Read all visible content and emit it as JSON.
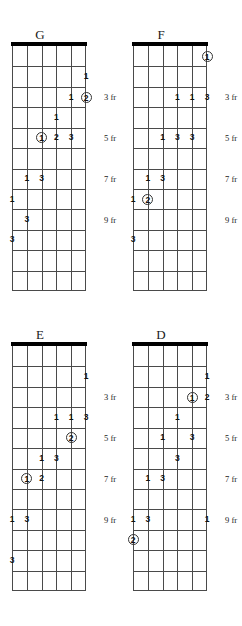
{
  "page": {
    "kind": "guitar-scale-diagrams",
    "width": 242,
    "height": 626,
    "strings": 6,
    "frets": 12,
    "ink_color": "#4a4a4a",
    "nut_color": "#000000",
    "text_color": "#1a1a1a"
  },
  "fret_label_text": {
    "f3": "3 fr",
    "f5": "5 fr",
    "f7": "7 fr",
    "f9": "9 fr"
  },
  "diagrams": [
    {
      "id": "diagram-g",
      "title": "G",
      "left": 0,
      "top": 28,
      "fret_labels": [
        {
          "text": "3 fr",
          "fret": 3
        },
        {
          "text": "5 fr",
          "fret": 5
        },
        {
          "text": "7 fr",
          "fret": 7
        },
        {
          "text": "9 fr",
          "fret": 9
        }
      ],
      "markers": [
        {
          "string": 1,
          "fret": 2,
          "label": "1",
          "circled": false
        },
        {
          "string": 2,
          "fret": 3,
          "label": "1",
          "circled": false
        },
        {
          "string": 1,
          "fret": 3,
          "label": "2",
          "circled": true
        },
        {
          "string": 3,
          "fret": 4,
          "label": "1",
          "circled": false
        },
        {
          "string": 4,
          "fret": 5,
          "label": "1",
          "circled": true
        },
        {
          "string": 3,
          "fret": 5,
          "label": "2",
          "circled": false
        },
        {
          "string": 2,
          "fret": 5,
          "label": "3",
          "circled": false
        },
        {
          "string": 5,
          "fret": 7,
          "label": "1",
          "circled": false
        },
        {
          "string": 4,
          "fret": 7,
          "label": "3",
          "circled": false
        },
        {
          "string": 6,
          "fret": 8,
          "label": "1",
          "circled": false
        },
        {
          "string": 5,
          "fret": 9,
          "label": "3",
          "circled": false
        },
        {
          "string": 6,
          "fret": 10,
          "label": "3",
          "circled": false
        }
      ]
    },
    {
      "id": "diagram-f",
      "title": "F",
      "left": 121,
      "top": 28,
      "fret_labels": [
        {
          "text": "3 fr",
          "fret": 3
        },
        {
          "text": "5 fr",
          "fret": 5
        },
        {
          "text": "7 fr",
          "fret": 7
        },
        {
          "text": "9 fr",
          "fret": 9
        }
      ],
      "markers": [
        {
          "string": 1,
          "fret": 1,
          "label": "1",
          "circled": true
        },
        {
          "string": 3,
          "fret": 3,
          "label": "1",
          "circled": false
        },
        {
          "string": 2,
          "fret": 3,
          "label": "1",
          "circled": false
        },
        {
          "string": 1,
          "fret": 3,
          "label": "3",
          "circled": false
        },
        {
          "string": 4,
          "fret": 5,
          "label": "1",
          "circled": false
        },
        {
          "string": 3,
          "fret": 5,
          "label": "3",
          "circled": false
        },
        {
          "string": 2,
          "fret": 5,
          "label": "3",
          "circled": false
        },
        {
          "string": 5,
          "fret": 7,
          "label": "1",
          "circled": false
        },
        {
          "string": 4,
          "fret": 7,
          "label": "3",
          "circled": false
        },
        {
          "string": 6,
          "fret": 8,
          "label": "1",
          "circled": false
        },
        {
          "string": 5,
          "fret": 8,
          "label": "2",
          "circled": true
        },
        {
          "string": 6,
          "fret": 10,
          "label": "3",
          "circled": false
        }
      ]
    },
    {
      "id": "diagram-e",
      "title": "E",
      "left": 0,
      "top": 328,
      "fret_labels": [
        {
          "text": "3 fr",
          "fret": 3
        },
        {
          "text": "5 fr",
          "fret": 5
        },
        {
          "text": "7 fr",
          "fret": 7
        },
        {
          "text": "9 fr",
          "fret": 9
        }
      ],
      "markers": [
        {
          "string": 1,
          "fret": 2,
          "label": "1",
          "circled": false
        },
        {
          "string": 3,
          "fret": 4,
          "label": "1",
          "circled": false
        },
        {
          "string": 2,
          "fret": 4,
          "label": "1",
          "circled": false
        },
        {
          "string": 1,
          "fret": 4,
          "label": "3",
          "circled": false
        },
        {
          "string": 2,
          "fret": 5,
          "label": "2",
          "circled": true
        },
        {
          "string": 4,
          "fret": 6,
          "label": "1",
          "circled": false
        },
        {
          "string": 3,
          "fret": 6,
          "label": "3",
          "circled": false
        },
        {
          "string": 5,
          "fret": 7,
          "label": "1",
          "circled": true
        },
        {
          "string": 4,
          "fret": 7,
          "label": "2",
          "circled": false
        },
        {
          "string": 6,
          "fret": 9,
          "label": "1",
          "circled": false
        },
        {
          "string": 5,
          "fret": 9,
          "label": "3",
          "circled": false
        },
        {
          "string": 6,
          "fret": 11,
          "label": "3",
          "circled": false
        }
      ]
    },
    {
      "id": "diagram-d",
      "title": "D",
      "left": 121,
      "top": 328,
      "fret_labels": [
        {
          "text": "3 fr",
          "fret": 3
        },
        {
          "text": "5 fr",
          "fret": 5
        },
        {
          "text": "7 fr",
          "fret": 7
        },
        {
          "text": "9 fr",
          "fret": 9
        }
      ],
      "markers": [
        {
          "string": 1,
          "fret": 2,
          "label": "1",
          "circled": false
        },
        {
          "string": 2,
          "fret": 3,
          "label": "1",
          "circled": true
        },
        {
          "string": 1,
          "fret": 3,
          "label": "2",
          "circled": false
        },
        {
          "string": 3,
          "fret": 4,
          "label": "1",
          "circled": false
        },
        {
          "string": 4,
          "fret": 5,
          "label": "1",
          "circled": false
        },
        {
          "string": 2,
          "fret": 5,
          "label": "3",
          "circled": false
        },
        {
          "string": 3,
          "fret": 6,
          "label": "3",
          "circled": false
        },
        {
          "string": 5,
          "fret": 7,
          "label": "1",
          "circled": false
        },
        {
          "string": 4,
          "fret": 7,
          "label": "3",
          "circled": false
        },
        {
          "string": 1,
          "fret": 9,
          "label": "1",
          "circled": false
        },
        {
          "string": 6,
          "fret": 9,
          "label": "1",
          "circled": false
        },
        {
          "string": 5,
          "fret": 9,
          "label": "3",
          "circled": false
        },
        {
          "string": 6,
          "fret": 10,
          "label": "2",
          "circled": true
        }
      ]
    }
  ]
}
